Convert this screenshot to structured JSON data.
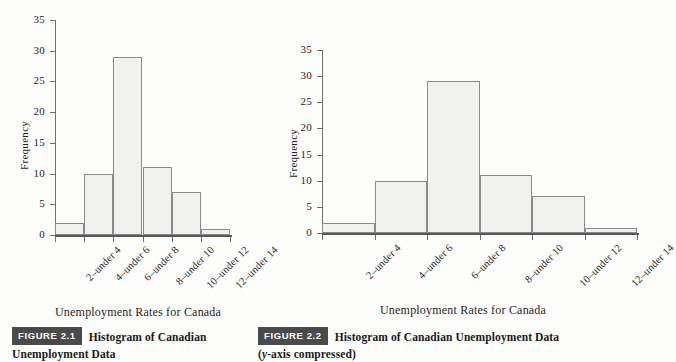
{
  "figures": [
    {
      "id": "figure-2-1",
      "badge": "FIGURE 2.1",
      "caption_line1": "Histogram of Canadian",
      "caption_line2": "Unemployment Data",
      "caption_full": "Histogram of Canadian Unemployment Data",
      "xaxis_title": "Unemployment Rates for Canada",
      "yaxis_title": "Frequency"
    },
    {
      "id": "figure-2-2",
      "badge": "FIGURE 2.2",
      "caption_line1": "Histogram of Canadian Unemployment Data",
      "caption_line2": "(y-axis compressed)",
      "caption_full": "Histogram of Canadian Unemployment Data (y-axis compressed)",
      "xaxis_title": "Unemployment Rates for Canada",
      "yaxis_title": "Frequency"
    }
  ],
  "colors": {
    "bar_fill": "#f1f1ef",
    "bar_stroke": "#8a8a8a",
    "axis": "#6f6f6f",
    "baseline": "#585858",
    "badge_bg": "#4a4a4a",
    "text": "#1a1a1a",
    "page_bg": "#fdfdfb"
  },
  "chart_data": [
    {
      "type": "bar",
      "title": "Histogram of Canadian Unemployment Data",
      "categories": [
        "2–under 4",
        "4–under 6",
        "6–under 8",
        "8–under 10",
        "10–under 12",
        "12–under 14"
      ],
      "values": [
        2,
        10,
        29,
        11,
        7,
        1
      ],
      "xlabel": "Unemployment Rates for Canada",
      "ylabel": "Frequency",
      "ylim": [
        0,
        35
      ],
      "yticks": [
        0,
        5,
        10,
        15,
        20,
        25,
        30,
        35
      ],
      "ytick_labels": [
        "0",
        "5",
        "10",
        "15",
        "20",
        "25",
        "30",
        "35"
      ],
      "grid": false,
      "legend": false,
      "note": "full height y-axis"
    },
    {
      "type": "bar",
      "title": "Histogram of Canadian Unemployment Data (y-axis compressed)",
      "categories": [
        "2–under 4",
        "4–under 6",
        "6–under 8",
        "8–under 10",
        "10–under 12",
        "12–under 14"
      ],
      "values": [
        2,
        10,
        29,
        11,
        7,
        1
      ],
      "xlabel": "Unemployment Rates for Canada",
      "ylabel": "Frequency",
      "ylim": [
        0,
        35
      ],
      "yticks": [
        0,
        5,
        10,
        15,
        20,
        25,
        30,
        35
      ],
      "ytick_labels": [
        "0",
        "5",
        "10",
        "15",
        "20",
        "25",
        "30",
        "35"
      ],
      "grid": false,
      "legend": false,
      "note": "y-axis compressed (same range, shorter pixel height)"
    }
  ]
}
